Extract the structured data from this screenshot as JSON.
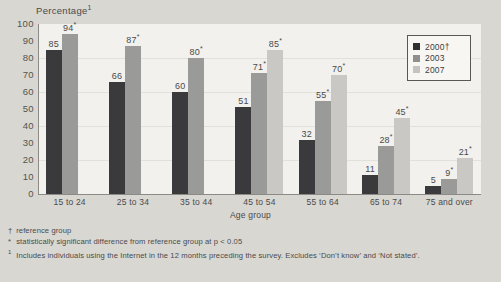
{
  "chart_data": {
    "type": "bar",
    "title": "",
    "ylabel": "Percentage",
    "ylabel_superscript": "1",
    "xlabel": "Age group",
    "ylim": [
      0,
      100
    ],
    "ytick_step": 10,
    "yticks": [
      "100",
      "90",
      "80",
      "70",
      "60",
      "50",
      "40",
      "30",
      "20",
      "10",
      "0"
    ],
    "grid": true,
    "legend_position": "top-right",
    "categories": [
      "15 to 24",
      "25 to 34",
      "35 to 44",
      "45 to 54",
      "55 to 64",
      "65 to 74",
      "75 and over"
    ],
    "series": [
      {
        "name": "2000",
        "marker": "†",
        "color": "#3a3a3c",
        "values": [
          85,
          66,
          60,
          51,
          32,
          11,
          5
        ],
        "labels": [
          "85",
          "66",
          "60",
          "51",
          "32",
          "11",
          "5"
        ],
        "significant": [
          false,
          false,
          false,
          false,
          false,
          false,
          false
        ]
      },
      {
        "name": "2003",
        "marker": "",
        "color": "#9a9a98",
        "values": [
          94,
          87,
          80,
          71,
          55,
          28,
          9
        ],
        "labels": [
          "94",
          "87",
          "80",
          "71",
          "55",
          "28",
          "9"
        ],
        "significant": [
          true,
          true,
          true,
          true,
          true,
          true,
          true
        ]
      },
      {
        "name": "2007",
        "marker": "",
        "color": "#c9c8c4",
        "values": [
          null,
          null,
          null,
          85,
          70,
          45,
          21
        ],
        "labels": [
          "",
          "",
          "",
          "85",
          "70",
          "45",
          "21"
        ],
        "significant": [
          false,
          false,
          false,
          true,
          true,
          true,
          true
        ]
      }
    ],
    "significance_symbol": "*"
  },
  "legend": {
    "items": [
      {
        "label": "2000†",
        "color": "#2f2f31"
      },
      {
        "label": "2003",
        "color": "#8f8f8d"
      },
      {
        "label": "2007",
        "color": "#c4c3bf"
      }
    ]
  },
  "footnotes": [
    {
      "mark": "†",
      "superscript": false,
      "text": "reference group"
    },
    {
      "mark": "*",
      "superscript": false,
      "text": "statistically significant difference from reference group at p < 0.05"
    },
    {
      "mark": "1",
      "superscript": true,
      "text": "Includes individuals using the Internet in the 12 months preceding the survey. Excludes ‘Don’t know’ and ‘Not stated’."
    }
  ]
}
